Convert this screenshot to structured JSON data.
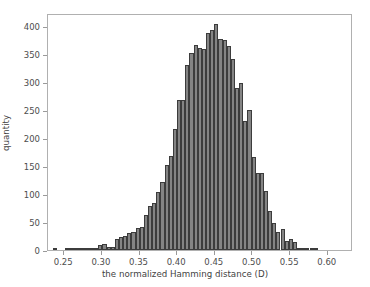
{
  "chart_data": {
    "type": "bar",
    "title": "",
    "subtitle": "",
    "xlabel": "the normalized Hamming distance (D)",
    "ylabel": "quantity",
    "xlim": [
      0.2285,
      0.6335
    ],
    "ylim": [
      0,
      424
    ],
    "grid": false,
    "legend": null,
    "bin_width": 0.0055,
    "bar_color": "#848484",
    "edge_color": "#3c3c3c",
    "xticks": [
      0.25,
      0.3,
      0.35,
      0.4,
      0.45,
      0.5,
      0.55,
      0.6
    ],
    "xtick_labels": [
      "0.25",
      "0.30",
      "0.35",
      "0.40",
      "0.45",
      "0.50",
      "0.55",
      "0.60"
    ],
    "yticks": [
      0,
      50,
      100,
      150,
      200,
      250,
      300,
      350,
      400
    ],
    "ytick_labels": [
      "0",
      "50",
      "100",
      "150",
      "200",
      "250",
      "300",
      "350",
      "400"
    ],
    "x": [
      0.2375,
      0.243,
      0.2485,
      0.254,
      0.2595,
      0.265,
      0.2705,
      0.276,
      0.2815,
      0.287,
      0.2925,
      0.298,
      0.3035,
      0.309,
      0.3145,
      0.32,
      0.3255,
      0.331,
      0.3365,
      0.342,
      0.3475,
      0.353,
      0.3585,
      0.364,
      0.3695,
      0.375,
      0.3805,
      0.386,
      0.3915,
      0.397,
      0.4025,
      0.408,
      0.4135,
      0.419,
      0.4245,
      0.43,
      0.4355,
      0.441,
      0.4465,
      0.452,
      0.4575,
      0.463,
      0.4685,
      0.474,
      0.4795,
      0.485,
      0.4905,
      0.496,
      0.5015,
      0.507,
      0.5125,
      0.518,
      0.5235,
      0.529,
      0.5345,
      0.54,
      0.5455,
      0.551,
      0.5565,
      0.562,
      0.5675,
      0.573,
      0.5785,
      0.584,
      0.5895,
      0.595,
      0.6005,
      0.606,
      0.6115,
      0.617,
      0.6225,
      0.628
    ],
    "values": [
      1,
      0,
      0,
      1,
      3,
      4,
      3,
      2,
      1,
      2,
      3,
      9,
      10,
      5,
      6,
      20,
      23,
      25,
      30,
      32,
      40,
      42,
      63,
      78,
      85,
      103,
      121,
      152,
      169,
      216,
      269,
      268,
      331,
      352,
      367,
      362,
      360,
      388,
      393,
      405,
      377,
      376,
      365,
      341,
      289,
      298,
      230,
      250,
      166,
      138,
      137,
      105,
      69,
      48,
      32,
      37,
      16,
      20,
      15,
      3,
      2,
      3,
      4,
      3,
      0,
      0,
      0,
      0,
      0,
      0,
      0,
      0
    ]
  }
}
